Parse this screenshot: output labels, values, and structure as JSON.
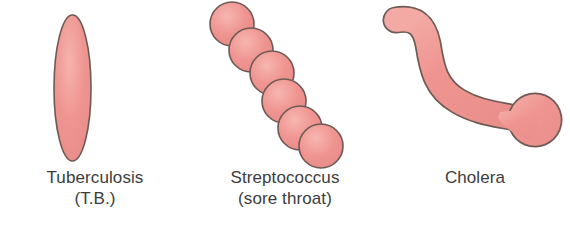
{
  "figure": {
    "background_color": "#ffffff",
    "width": 570,
    "height": 226
  },
  "style": {
    "fill_color": "#ef9490",
    "fill_color_light": "#f4aaa6",
    "outline_color": "#6d5a54",
    "text_color": "#3c3c3c"
  },
  "panels": [
    {
      "id": "tuberculosis",
      "shape_name": "rod-oval-bacillus",
      "shape_description": "single elongated vertical oval (rod-shaped bacillus)",
      "label": "Tuberculosis",
      "sublabel": "(T.B.)"
    },
    {
      "id": "streptococcus",
      "shape_name": "coccus-chain",
      "shape_description": "chain of six round cocci arranged diagonally from upper-left to lower-right",
      "coccus_count": 6,
      "label": "Streptococcus",
      "sublabel": "(sore throat)"
    },
    {
      "id": "cholera",
      "shape_name": "curved-comma-vibrio",
      "shape_description": "S-curved comma-shaped vibrio with a rounded tip at upper-left and a bulbous knob at lower-right",
      "label": "Cholera",
      "sublabel": ""
    }
  ]
}
